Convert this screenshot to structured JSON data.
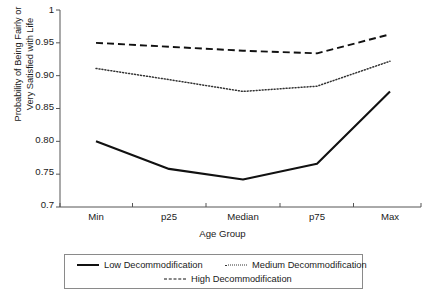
{
  "chart_data": {
    "type": "line",
    "title": "",
    "subtitle": "",
    "xlabel": "Age Group",
    "ylabel": "Probability of Being Fairly or Very Satisfied with Life",
    "ylabel_line1": "Probability of Being Fairly or",
    "ylabel_line2": "Very Satisfied with Life",
    "categories": [
      "Min",
      "p25",
      "Median",
      "p75",
      "Max"
    ],
    "x": [
      0,
      1,
      2,
      3,
      4
    ],
    "ylim": [
      0.7,
      1.0
    ],
    "yticks": [
      0.7,
      0.75,
      0.8,
      0.85,
      0.9,
      0.95,
      1.0
    ],
    "ytick_labels": [
      "0.7",
      "0.75",
      "0.80",
      "0.85",
      "0.90",
      "0.95",
      "1"
    ],
    "grid": false,
    "legend_position": "bottom",
    "series": [
      {
        "name": "Low Decommodification",
        "style": "solid",
        "color": "#111111",
        "values": [
          0.8,
          0.758,
          0.742,
          0.766,
          0.876
        ]
      },
      {
        "name": "Medium Decommodification",
        "style": "dotted",
        "color": "#333333",
        "values": [
          0.911,
          0.894,
          0.876,
          0.884,
          0.922
        ]
      },
      {
        "name": "High Decommodification",
        "style": "dashed",
        "color": "#111111",
        "values": [
          0.95,
          0.944,
          0.938,
          0.934,
          0.963
        ]
      }
    ]
  },
  "axes": {
    "x_tick_labels": [
      "Min",
      "p25",
      "Median",
      "p75",
      "Max"
    ],
    "y_tick_labels": [
      "1",
      "0.95",
      "0.90",
      "0.85",
      "0.80",
      "0.75",
      "0.7"
    ],
    "axis_color": "#555555"
  },
  "legend": {
    "items": [
      {
        "label": "Low Decommodification",
        "style": "solid"
      },
      {
        "label": "Medium Decommodification",
        "style": "dotted"
      },
      {
        "label": "High Decommodification",
        "style": "dashed"
      }
    ]
  }
}
